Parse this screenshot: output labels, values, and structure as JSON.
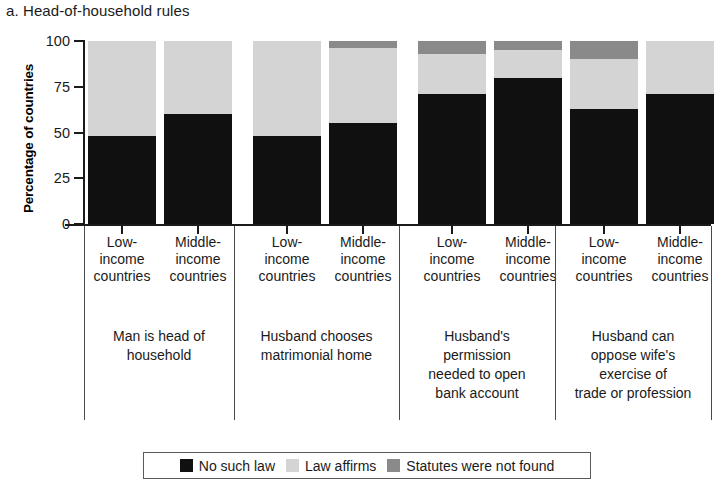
{
  "panel": {
    "title": "a. Head-of-household rules"
  },
  "chart_data": {
    "type": "bar",
    "subtype": "stacked-bar-grouped",
    "title": "a. Head-of-household rules",
    "xlabel": "",
    "ylabel": "Percentage of countries",
    "ylim": [
      0,
      100
    ],
    "yticks": [
      0,
      25,
      50,
      75,
      100
    ],
    "ytick_labels": [
      "0",
      "25",
      "50",
      "75",
      "100"
    ],
    "grid": false,
    "legend_position": "bottom",
    "stack_order": [
      "No such law",
      "Law affirms",
      "Statutes were not found"
    ],
    "categories": [
      "Low-income countries",
      "Middle-income countries",
      "Low-income countries",
      "Middle-income countries",
      "Low-income countries",
      "Middle-income countries",
      "Low-income countries",
      "Middle-income countries"
    ],
    "groups": [
      {
        "label": "Man is head of household",
        "label_lines": [
          "Man is head of",
          "household"
        ],
        "bars": [
          {
            "category": "Low-income countries",
            "category_lines": [
              "Low-",
              "income",
              "countries"
            ],
            "no_such_law": 48,
            "law_affirms": 52,
            "statutes_not_found": 0
          },
          {
            "category": "Middle-income countries",
            "category_lines": [
              "Middle-",
              "income",
              "countries"
            ],
            "no_such_law": 60,
            "law_affirms": 40,
            "statutes_not_found": 0
          }
        ]
      },
      {
        "label": "Husband chooses matrimonial home",
        "label_lines": [
          "Husband chooses",
          "matrimonial home"
        ],
        "bars": [
          {
            "category": "Low-income countries",
            "category_lines": [
              "Low-",
              "income",
              "countries"
            ],
            "no_such_law": 48,
            "law_affirms": 52,
            "statutes_not_found": 0
          },
          {
            "category": "Middle-income countries",
            "category_lines": [
              "Middle-",
              "income",
              "countries"
            ],
            "no_such_law": 55,
            "law_affirms": 41,
            "statutes_not_found": 4
          }
        ]
      },
      {
        "label": "Husband's permission needed to open bank account",
        "label_lines": [
          "Husband's",
          "permission",
          "needed to open",
          "bank account"
        ],
        "bars": [
          {
            "category": "Low-income countries",
            "category_lines": [
              "Low-",
              "income",
              "countries"
            ],
            "no_such_law": 71,
            "law_affirms": 22,
            "statutes_not_found": 7
          },
          {
            "category": "Middle-income countries",
            "category_lines": [
              "Middle-",
              "income",
              "countries"
            ],
            "no_such_law": 80,
            "law_affirms": 15,
            "statutes_not_found": 5
          }
        ]
      },
      {
        "label": "Husband can oppose wife's exercise of trade or profession",
        "label_lines": [
          "Husband can",
          "oppose wife's",
          "exercise of",
          "trade or profession"
        ],
        "bars": [
          {
            "category": "Low-income countries",
            "category_lines": [
              "Low-",
              "income",
              "countries"
            ],
            "no_such_law": 63,
            "law_affirms": 27,
            "statutes_not_found": 10
          },
          {
            "category": "Middle-income countries",
            "category_lines": [
              "Middle-",
              "income",
              "countries"
            ],
            "no_such_law": 71,
            "law_affirms": 29,
            "statutes_not_found": 0
          }
        ]
      }
    ],
    "series": [
      {
        "name": "No such law",
        "color": "#101010",
        "values": [
          48,
          60,
          48,
          55,
          71,
          80,
          63,
          71
        ]
      },
      {
        "name": "Law affirms",
        "color": "#d4d4d4",
        "values": [
          52,
          40,
          52,
          41,
          22,
          15,
          27,
          29
        ]
      },
      {
        "name": "Statutes were not found",
        "color": "#8a8a8a",
        "values": [
          0,
          0,
          0,
          4,
          7,
          5,
          10,
          0
        ]
      }
    ]
  },
  "legend": {
    "items": [
      {
        "label": "No such law",
        "color": "#101010"
      },
      {
        "label": "Law affirms",
        "color": "#d4d4d4"
      },
      {
        "label": "Statutes were not found",
        "color": "#8a8a8a"
      }
    ]
  }
}
